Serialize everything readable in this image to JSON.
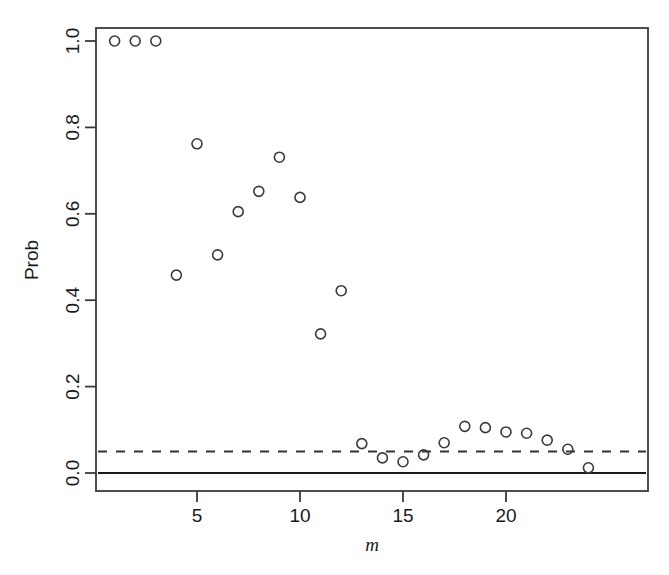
{
  "chart_data": {
    "type": "scatter",
    "title": "",
    "xlabel": "m",
    "ylabel": "Prob",
    "xlim": [
      0.3,
      25.0
    ],
    "ylim": [
      -0.03,
      1.04
    ],
    "grid": false,
    "legend": null,
    "point_style": {
      "marker": "open-circle",
      "radius": 5,
      "stroke": "#3a3a3a",
      "stroke_width": 1.6,
      "fill": "none"
    },
    "x": [
      1,
      2,
      3,
      4,
      5,
      6,
      7,
      8,
      9,
      10,
      11,
      12,
      13,
      14,
      15,
      16,
      17,
      18,
      19,
      20,
      21,
      22,
      23,
      24
    ],
    "y": [
      1.0,
      1.0,
      1.0,
      0.458,
      0.762,
      0.505,
      0.605,
      0.652,
      0.731,
      0.638,
      0.322,
      0.422,
      0.068,
      0.035,
      0.026,
      0.042,
      0.07,
      0.108,
      0.105,
      0.095,
      0.092,
      0.076,
      0.055,
      0.012
    ],
    "xticks": [
      5,
      10,
      15,
      20
    ],
    "xtick_labels": [
      "5",
      "10",
      "15",
      "20"
    ],
    "yticks": [
      0.0,
      0.2,
      0.4,
      0.6,
      0.8,
      1.0
    ],
    "ytick_labels": [
      "0.0",
      "0.2",
      "0.4",
      "0.6",
      "0.8",
      "1.0"
    ],
    "reference_lines": [
      {
        "name": "significance-threshold",
        "orientation": "horizontal",
        "value": 0.05,
        "style": "dashed",
        "color": "#333333"
      },
      {
        "name": "zero-baseline",
        "orientation": "horizontal",
        "value": 0.0,
        "style": "solid",
        "color": "#1a1a1a"
      }
    ],
    "annotations": []
  },
  "axes": {
    "y_axis_title": "Prob",
    "x_axis_title": "m"
  },
  "colors": {
    "background": "#ffffff",
    "frame": "#3a3a3a",
    "point": "#3a3a3a",
    "dashed_line": "#333333",
    "solid_line": "#1a1a1a",
    "text": "#1a1a1a"
  }
}
